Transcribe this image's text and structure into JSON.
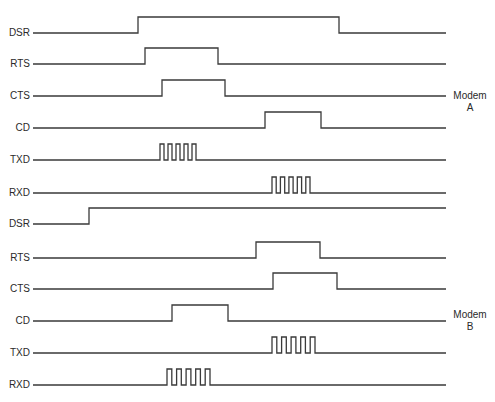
{
  "diagram": {
    "title": "",
    "line_color": "#3a3a3a",
    "x_start": 33,
    "x_end": 446,
    "pulse_height": 16,
    "modems": [
      {
        "name": "Modem A",
        "label_line1": "Modem",
        "label_line2": "A",
        "label_y": 90,
        "signals": [
          {
            "name": "DSR",
            "y": 33,
            "kind": "level",
            "edges": [
              138,
              339
            ]
          },
          {
            "name": "RTS",
            "y": 64,
            "kind": "level",
            "edges": [
              145,
              218
            ]
          },
          {
            "name": "CTS",
            "y": 96,
            "kind": "level",
            "edges": [
              162,
              225
            ]
          },
          {
            "name": "CD",
            "y": 128,
            "kind": "level",
            "edges": [
              265,
              321
            ]
          },
          {
            "name": "TXD",
            "y": 160,
            "kind": "data",
            "burst_start": 160,
            "burst_end": 196,
            "pulses": 5
          },
          {
            "name": "RXD",
            "y": 193,
            "kind": "data",
            "burst_start": 272,
            "burst_end": 310,
            "pulses": 5
          }
        ]
      },
      {
        "name": "Modem B",
        "label_line1": "Modem",
        "label_line2": "B",
        "label_y": 309,
        "signals": [
          {
            "name": "DSR",
            "y": 224,
            "kind": "level",
            "edges": [
              89
            ]
          },
          {
            "name": "RTS",
            "y": 258,
            "kind": "level",
            "edges": [
              256,
              320
            ]
          },
          {
            "name": "CTS",
            "y": 289,
            "kind": "level",
            "edges": [
              273,
              337
            ]
          },
          {
            "name": "CD",
            "y": 321,
            "kind": "level",
            "edges": [
              172,
              228
            ]
          },
          {
            "name": "TXD",
            "y": 353,
            "kind": "data",
            "burst_start": 272,
            "burst_end": 315,
            "pulses": 5
          },
          {
            "name": "RXD",
            "y": 385,
            "kind": "data",
            "burst_start": 167,
            "burst_end": 210,
            "pulses": 5
          }
        ]
      }
    ]
  }
}
